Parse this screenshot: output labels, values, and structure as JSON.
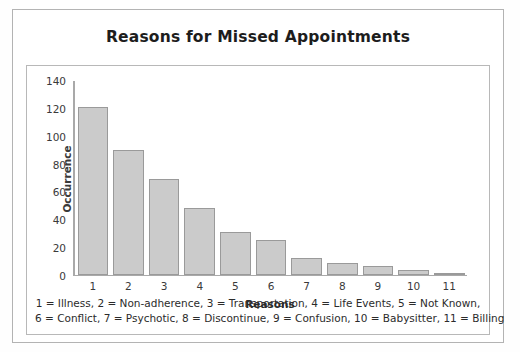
{
  "chart_data": {
    "type": "bar",
    "title": "Reasons for Missed Appointments",
    "xlabel": "Reasons",
    "ylabel": "Occurrence",
    "categories": [
      "1",
      "2",
      "3",
      "4",
      "5",
      "6",
      "7",
      "8",
      "9",
      "10",
      "11"
    ],
    "values": [
      121,
      90,
      69,
      48,
      31,
      25,
      12,
      8,
      6,
      3,
      1
    ],
    "ylim": [
      0,
      140
    ],
    "yticks": [
      0,
      20,
      40,
      60,
      80,
      100,
      120,
      140
    ],
    "grid": false,
    "legend_position": "below-plot",
    "series_color": "#cbcbcb",
    "series_border_color": "#9a9a9a",
    "category_legend": [
      {
        "key": "1",
        "label": "Illness"
      },
      {
        "key": "2",
        "label": "Non-adherence"
      },
      {
        "key": "3",
        "label": "Transportation"
      },
      {
        "key": "4",
        "label": "Life Events"
      },
      {
        "key": "5",
        "label": "Not Known"
      },
      {
        "key": "6",
        "label": "Conflict"
      },
      {
        "key": "7",
        "label": "Psychotic"
      },
      {
        "key": "8",
        "label": "Discontinue"
      },
      {
        "key": "9",
        "label": "Confusion"
      },
      {
        "key": "10",
        "label": "Babysitter"
      },
      {
        "key": "11",
        "label": "Billing"
      }
    ],
    "legend_lines": [
      "1 = Illness, 2 = Non-adherence, 3 = Transportation, 4 = Life Events, 5 = Not Known,",
      "6 = Conflict, 7 = Psychotic, 8 = Discontinue, 9 = Confusion, 10 = Babysitter, 11 = Billing"
    ]
  }
}
